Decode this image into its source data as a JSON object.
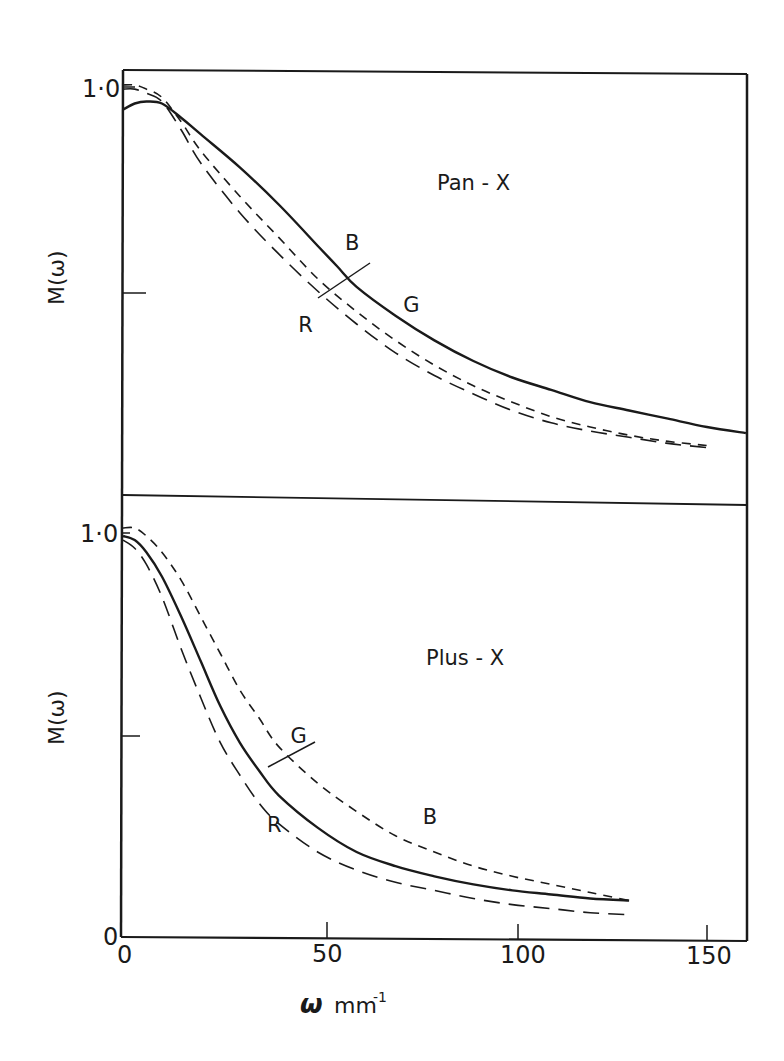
{
  "chart_data": [
    {
      "type": "line",
      "title": "Pan - X",
      "xlabel": "ω mm⁻¹",
      "ylabel": "M(ω)",
      "xlim": [
        0,
        160
      ],
      "ylim": [
        0,
        1.0
      ],
      "x_ticks": [
        0,
        50,
        100,
        150
      ],
      "y_ticks": [
        0.5,
        1.0
      ],
      "y_tick_labels": {
        "1.0": "1·0"
      },
      "grid": false,
      "series": [
        {
          "name": "G",
          "style": "solid",
          "x": [
            0,
            3,
            6,
            10,
            15,
            20,
            30,
            40,
            50,
            55,
            60,
            70,
            80,
            90,
            100,
            110,
            120,
            130,
            140,
            150,
            160
          ],
          "y": [
            0.94,
            0.955,
            0.96,
            0.955,
            0.92,
            0.88,
            0.8,
            0.71,
            0.61,
            0.56,
            0.51,
            0.44,
            0.38,
            0.33,
            0.29,
            0.26,
            0.23,
            0.21,
            0.19,
            0.17,
            0.155
          ]
        },
        {
          "name": "B",
          "style": "short-dash",
          "x": [
            0,
            3,
            6,
            10,
            15,
            20,
            30,
            40,
            50,
            60,
            70,
            80,
            90,
            100,
            110,
            120,
            130,
            140,
            150
          ],
          "y": [
            1.0,
            1.0,
            0.99,
            0.97,
            0.91,
            0.84,
            0.73,
            0.63,
            0.53,
            0.45,
            0.38,
            0.32,
            0.27,
            0.23,
            0.195,
            0.17,
            0.15,
            0.135,
            0.125
          ]
        },
        {
          "name": "R",
          "style": "long-dash",
          "x": [
            0,
            3,
            6,
            10,
            15,
            20,
            30,
            40,
            50,
            60,
            70,
            80,
            90,
            100,
            110,
            120,
            130,
            140,
            150
          ],
          "y": [
            0.99,
            0.99,
            0.98,
            0.96,
            0.89,
            0.81,
            0.69,
            0.59,
            0.5,
            0.42,
            0.35,
            0.295,
            0.25,
            0.21,
            0.18,
            0.16,
            0.145,
            0.13,
            0.12
          ]
        }
      ],
      "annotations": [
        {
          "text": "Pan - X",
          "x": 85,
          "y": 0.82
        },
        {
          "text": "B",
          "x": 57,
          "y": 0.6
        },
        {
          "text": "G",
          "x": 72,
          "y": 0.45
        },
        {
          "text": "R",
          "x": 45,
          "y": 0.4
        }
      ]
    },
    {
      "type": "line",
      "title": "Plus - X",
      "xlabel": "ω mm⁻¹",
      "ylabel": "M(ω)",
      "xlim": [
        0,
        160
      ],
      "ylim": [
        0,
        1.0
      ],
      "x_ticks": [
        0,
        50,
        100,
        150
      ],
      "y_ticks": [
        0,
        0.5,
        1.0
      ],
      "grid": false,
      "series": [
        {
          "name": "G",
          "style": "solid",
          "x": [
            0,
            3,
            6,
            10,
            15,
            20,
            25,
            30,
            35,
            40,
            50,
            60,
            70,
            80,
            90,
            100,
            110,
            120,
            130
          ],
          "y": [
            0.99,
            0.98,
            0.95,
            0.89,
            0.79,
            0.68,
            0.57,
            0.48,
            0.41,
            0.35,
            0.27,
            0.21,
            0.175,
            0.15,
            0.13,
            0.115,
            0.105,
            0.095,
            0.09
          ]
        },
        {
          "name": "B",
          "style": "short-dash",
          "x": [
            0,
            3,
            6,
            10,
            15,
            20,
            25,
            30,
            35,
            40,
            50,
            60,
            70,
            80,
            90,
            100,
            110,
            120,
            130
          ],
          "y": [
            1.01,
            1.01,
            0.99,
            0.95,
            0.88,
            0.79,
            0.7,
            0.61,
            0.54,
            0.47,
            0.38,
            0.31,
            0.25,
            0.21,
            0.175,
            0.15,
            0.13,
            0.11,
            0.09
          ]
        },
        {
          "name": "R",
          "style": "long-dash",
          "x": [
            0,
            3,
            6,
            10,
            15,
            20,
            25,
            30,
            35,
            40,
            50,
            60,
            70,
            80,
            90,
            100,
            110,
            120,
            130
          ],
          "y": [
            0.98,
            0.96,
            0.92,
            0.84,
            0.71,
            0.59,
            0.48,
            0.4,
            0.33,
            0.28,
            0.21,
            0.165,
            0.135,
            0.115,
            0.095,
            0.08,
            0.07,
            0.06,
            0.055
          ]
        }
      ],
      "annotations": [
        {
          "text": "Plus - X",
          "x": 85,
          "y": 0.73
        },
        {
          "text": "G",
          "x": 43,
          "y": 0.48
        },
        {
          "text": "B",
          "x": 77,
          "y": 0.28
        },
        {
          "text": "R",
          "x": 37,
          "y": 0.26
        }
      ]
    }
  ],
  "labels": {
    "top_ylabel": "M(ω)",
    "bottom_ylabel": "M(ω)",
    "top_title": "Pan - X",
    "bottom_title": "Plus - X",
    "xlabel_omega": "ω",
    "xlabel_unit": "mm",
    "xlabel_exp": "-1",
    "y_tick_top_1": "1·0",
    "y_tick_bottom_1": "1·0",
    "y_tick_bottom_0": "0",
    "x_tick_0": "0",
    "x_tick_50": "50",
    "x_tick_100": "100",
    "x_tick_150": "150"
  }
}
